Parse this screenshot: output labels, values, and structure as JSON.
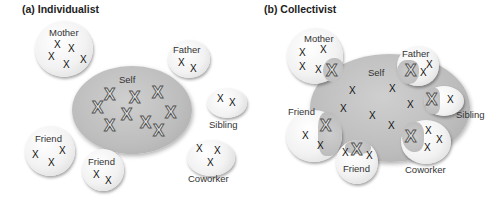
{
  "panels": [
    {
      "id": "a",
      "title": "(a)  Individualist",
      "self": {
        "label": "Self"
      },
      "others": [
        {
          "label": "Mother"
        },
        {
          "label": "Father"
        },
        {
          "label": "Sibling"
        },
        {
          "label": "Friend"
        },
        {
          "label": "Friend"
        },
        {
          "label": "Coworker"
        }
      ]
    },
    {
      "id": "b",
      "title": "(b)  Collectivist",
      "self": {
        "label": "Self"
      },
      "others": [
        {
          "label": "Mother"
        },
        {
          "label": "Father"
        },
        {
          "label": "Sibling"
        },
        {
          "label": "Friend"
        },
        {
          "label": "Friend"
        },
        {
          "label": "Coworker"
        }
      ]
    }
  ],
  "glyphs": {
    "x": "X",
    "big_x": "X"
  },
  "colors": {
    "self_fill": "#bdbdbd",
    "other_fill": "#f2f2f2",
    "background": "#ffffff"
  }
}
